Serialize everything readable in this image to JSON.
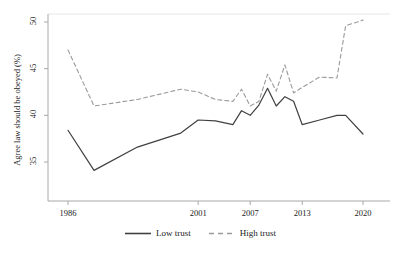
{
  "chart_data": {
    "type": "line",
    "title": "",
    "xlabel": "",
    "ylabel": "Agree law should be obeyed (%)",
    "xlim": [
      1986,
      2020
    ],
    "ylim": [
      33.5,
      50.5
    ],
    "grid": false,
    "legend_position": "bottom",
    "xticks": [
      1986,
      2001,
      2007,
      2013,
      2020
    ],
    "xtick_labels": [
      "1986",
      "2001",
      "2007",
      "2013",
      "2020"
    ],
    "yticks": [
      35,
      40,
      45,
      50
    ],
    "ytick_labels": [
      "35",
      "40",
      "45",
      "50"
    ],
    "x": [
      1986,
      1989,
      1994,
      1999,
      2001,
      2003,
      2005,
      2006,
      2007,
      2008,
      2009,
      2010,
      2011,
      2012,
      2013,
      2015,
      2017,
      2018,
      2020
    ],
    "series": [
      {
        "name": "Low trust",
        "style": "solid",
        "color": "#404040",
        "values": [
          38.4,
          34.1,
          36.6,
          38.1,
          39.5,
          39.4,
          39.0,
          40.5,
          40.0,
          41.1,
          42.9,
          41.0,
          42.0,
          41.5,
          39.0,
          39.5,
          40.0,
          40.0,
          38.0
        ]
      },
      {
        "name": "High trust",
        "style": "dashed",
        "color": "#9a9a9a",
        "values": [
          47.0,
          41.0,
          41.7,
          42.8,
          42.5,
          41.7,
          41.5,
          42.8,
          41.0,
          41.5,
          44.4,
          42.6,
          45.4,
          42.4,
          43.0,
          44.1,
          44.0,
          49.6,
          50.2
        ]
      }
    ]
  },
  "legend": {
    "items": [
      {
        "label": "Low trust",
        "style": "solid"
      },
      {
        "label": "High trust",
        "style": "dashed"
      }
    ]
  }
}
